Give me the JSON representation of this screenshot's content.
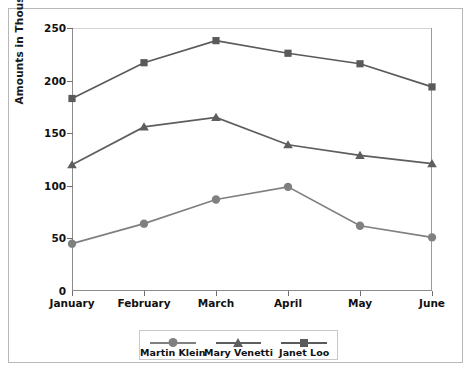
{
  "chart_data": {
    "type": "line",
    "title": "",
    "xlabel": "",
    "ylabel": "Amounts in Thousands",
    "categories": [
      "January",
      "February",
      "March",
      "April",
      "May",
      "June"
    ],
    "ylim": [
      0,
      250
    ],
    "y_ticks": [
      0,
      50,
      100,
      150,
      200,
      250
    ],
    "grid": false,
    "legend_position": "bottom",
    "series": [
      {
        "name": "Martin Klein",
        "marker": "circle",
        "color": "#808080",
        "values": [
          45,
          64,
          87,
          99,
          62,
          51
        ]
      },
      {
        "name": "Mary Venetti",
        "marker": "triangle",
        "color": "#5e5e5e",
        "values": [
          120,
          156,
          165,
          139,
          129,
          121
        ]
      },
      {
        "name": "Janet Loo",
        "marker": "square",
        "color": "#5a5a5a",
        "values": [
          183,
          217,
          238,
          226,
          216,
          194
        ]
      }
    ]
  },
  "axis": {
    "y_title": "Amounts in Thousands",
    "y_tick_labels": [
      "0",
      "50",
      "100",
      "150",
      "200",
      "250"
    ],
    "x_tick_labels": [
      "January",
      "February",
      "March",
      "April",
      "May",
      "June"
    ]
  },
  "legend": {
    "entries": [
      {
        "label": "Martin Klein",
        "marker": "circle",
        "color": "#808080"
      },
      {
        "label": "Mary Venetti",
        "marker": "triangle",
        "color": "#5e5e5e"
      },
      {
        "label": "Janet Loo",
        "marker": "square",
        "color": "#5a5a5a"
      }
    ]
  },
  "style": {
    "frame_border": "#b8b8b8",
    "axis_color": "#8c8c8c",
    "background": "#ffffff",
    "text_color": "#111111"
  }
}
